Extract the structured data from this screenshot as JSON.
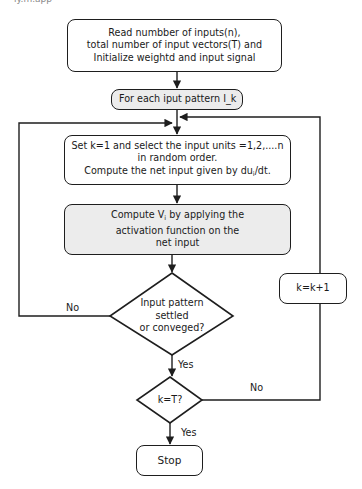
{
  "diagram": {
    "type": "flowchart",
    "top_fragment": "ly.m.app",
    "nodes": {
      "init": {
        "lines": [
          "Read numbber of inputs(n),",
          "total number of input vectors(T) and",
          "Initialize weightd and input signal"
        ]
      },
      "for_each": {
        "label": "For each iput pattern I_k"
      },
      "set_k": {
        "lines": [
          "Set k=1 and select the input units =1,2,....n",
          "in random order."
        ],
        "line3_prefix": "Compute the net input given by du",
        "line3_sub": "i",
        "line3_suffix": "/dt."
      },
      "compute_v": {
        "line1_prefix": "Compute V",
        "line1_sub": "i",
        "line1_suffix": " by applying the",
        "lines_rest": [
          "activation function on the",
          "net input"
        ]
      },
      "decision_settled": {
        "lines": [
          "Input pattern",
          "settled",
          "or conveged?"
        ]
      },
      "increment": {
        "label": "k=k+1"
      },
      "decision_k_t": {
        "label": "k=T?"
      },
      "stop": {
        "label": "Stop"
      }
    },
    "edge_labels": {
      "settled_no": "No",
      "settled_yes": "Yes",
      "kt_no": "No",
      "kt_yes": "Yes"
    },
    "colors": {
      "stroke": "#1e1e1e",
      "shaded_fill": "#ececec",
      "background": "#ffffff"
    }
  }
}
